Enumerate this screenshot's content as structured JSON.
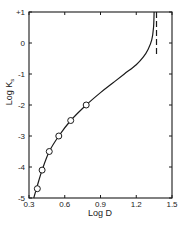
{
  "chart_data": {
    "type": "line",
    "title": "",
    "xlabel": "Log D",
    "ylabel": "Log K_s",
    "xlim": [
      0.3,
      1.5
    ],
    "ylim": [
      -5,
      1
    ],
    "grid": false,
    "legend": null,
    "x_ticks": [
      0.3,
      0.6,
      0.9,
      1.2,
      1.5
    ],
    "x_tick_labels": [
      "0.3",
      "0.6",
      "0.9",
      "1.2",
      "1.5"
    ],
    "y_ticks": [
      1,
      0,
      -1,
      -2,
      -3,
      -4,
      -5
    ],
    "y_tick_labels": [
      "+1",
      "0",
      "-1",
      "-2",
      "-3",
      "-4",
      "-5"
    ],
    "series": [
      {
        "name": "experimental points",
        "style": "open-circles",
        "x": [
          0.37,
          0.41,
          0.47,
          0.55,
          0.65,
          0.78
        ],
        "y": [
          -4.7,
          -4.1,
          -3.5,
          -3.0,
          -2.5,
          -2.0
        ]
      },
      {
        "name": "fitted curve",
        "style": "solid-line",
        "x": [
          0.34,
          0.37,
          0.41,
          0.47,
          0.55,
          0.65,
          0.78,
          0.9,
          1.0,
          1.1,
          1.2,
          1.26,
          1.3,
          1.33,
          1.345,
          1.35
        ],
        "y": [
          -5.0,
          -4.6,
          -4.1,
          -3.5,
          -3.0,
          -2.5,
          -2.0,
          -1.6,
          -1.3,
          -1.0,
          -0.7,
          -0.45,
          -0.2,
          0.1,
          0.5,
          1.0
        ]
      },
      {
        "name": "asymptote",
        "style": "dashed-vertical-line",
        "x": [
          1.37,
          1.37
        ],
        "y": [
          1.0,
          -0.4
        ]
      }
    ]
  },
  "axes": {
    "xlabel": "Log D",
    "ylabel_main": "Log K",
    "ylabel_sub": "s"
  }
}
